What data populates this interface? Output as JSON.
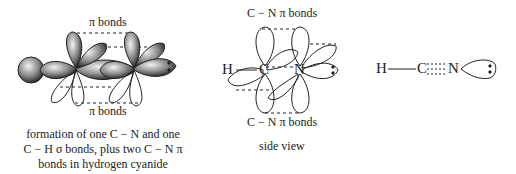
{
  "left_panel": {
    "top_label": "π bonds",
    "bottom_label": "π bonds",
    "caption_lines": [
      "formation of one C − N and one",
      "C − H σ bonds, plus two C − N π",
      "bonds in hydrogen cyanide"
    ]
  },
  "middle_panel": {
    "top_label": "C − N π bonds",
    "bottom_label": "C − N π bonds",
    "atoms": {
      "h": "H",
      "c": "C",
      "n": "N"
    },
    "lone_pair": ":",
    "caption": "side view"
  },
  "right_panel": {
    "atoms": {
      "h": "H",
      "c": "C",
      "n": "N"
    },
    "lone_pair": ":"
  },
  "colors": {
    "line": "#222222",
    "shade_dark": "#3a3a3a",
    "shade_light": "#d8d8d8"
  }
}
